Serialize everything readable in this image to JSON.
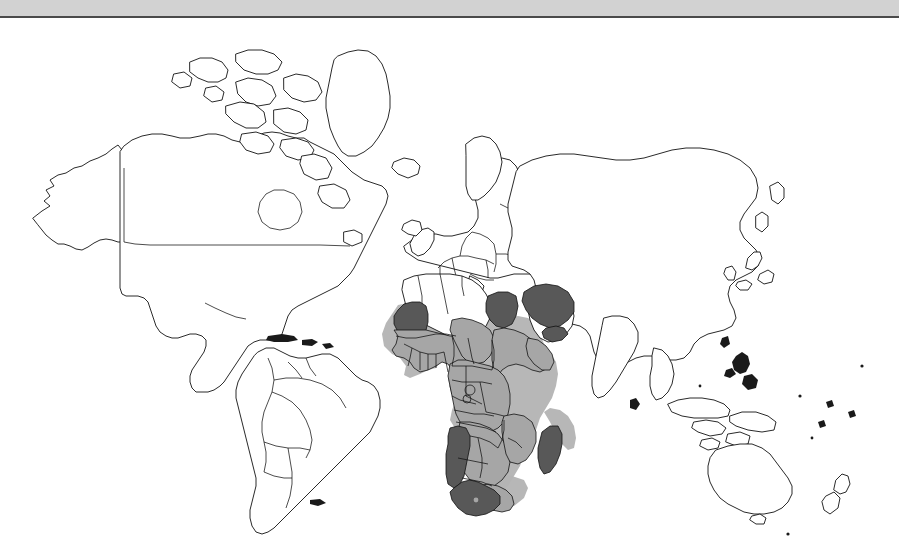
{
  "window": {
    "titlebar_color": "#d2d2d2",
    "background_color": "#ffffff"
  },
  "map": {
    "name": "world-choropleth-map",
    "projection": "miller-cylindrical",
    "outline_color": "#121212",
    "ocean_color": "#ffffff",
    "land_default_color": "#ffffff",
    "shade_light_color": "#a6a6a6",
    "shade_dark_color": "#585858",
    "halo_color": "#b3b3b3",
    "categories": [
      {
        "key": "none",
        "label": "",
        "color": "#ffffff"
      },
      {
        "key": "light",
        "label": "",
        "color": "#a6a6a6"
      },
      {
        "key": "dark",
        "label": "",
        "color": "#585858"
      }
    ],
    "regions": [
      {
        "id": "mauritania",
        "shade": "dark"
      },
      {
        "id": "senegal",
        "shade": "light"
      },
      {
        "id": "gambia",
        "shade": "light"
      },
      {
        "id": "guinea-bissau",
        "shade": "light"
      },
      {
        "id": "guinea",
        "shade": "light"
      },
      {
        "id": "sierra-leone",
        "shade": "light"
      },
      {
        "id": "liberia",
        "shade": "light"
      },
      {
        "id": "cote-divoire",
        "shade": "light"
      },
      {
        "id": "mali",
        "shade": "light"
      },
      {
        "id": "burkina-faso",
        "shade": "light"
      },
      {
        "id": "ghana",
        "shade": "light"
      },
      {
        "id": "togo",
        "shade": "light"
      },
      {
        "id": "benin",
        "shade": "light"
      },
      {
        "id": "niger",
        "shade": "light"
      },
      {
        "id": "nigeria",
        "shade": "light"
      },
      {
        "id": "chad",
        "shade": "light"
      },
      {
        "id": "cameroon",
        "shade": "light"
      },
      {
        "id": "central-african-republic",
        "shade": "light"
      },
      {
        "id": "sudan",
        "shade": "light"
      },
      {
        "id": "south-sudan",
        "shade": "light"
      },
      {
        "id": "ethiopia",
        "shade": "light"
      },
      {
        "id": "eritrea",
        "shade": "light"
      },
      {
        "id": "djibouti",
        "shade": "light"
      },
      {
        "id": "somalia",
        "shade": "light"
      },
      {
        "id": "kenya",
        "shade": "light"
      },
      {
        "id": "uganda",
        "shade": "light"
      },
      {
        "id": "rwanda",
        "shade": "light"
      },
      {
        "id": "burundi",
        "shade": "light"
      },
      {
        "id": "tanzania",
        "shade": "light"
      },
      {
        "id": "dr-congo",
        "shade": "light"
      },
      {
        "id": "congo",
        "shade": "light"
      },
      {
        "id": "gabon",
        "shade": "light"
      },
      {
        "id": "angola",
        "shade": "light"
      },
      {
        "id": "zambia",
        "shade": "light"
      },
      {
        "id": "malawi",
        "shade": "light"
      },
      {
        "id": "mozambique",
        "shade": "light"
      },
      {
        "id": "zimbabwe",
        "shade": "light"
      },
      {
        "id": "botswana",
        "shade": "light"
      },
      {
        "id": "lesotho",
        "shade": "light"
      },
      {
        "id": "egypt",
        "shade": "dark"
      },
      {
        "id": "saudi-arabia",
        "shade": "dark"
      },
      {
        "id": "yemen",
        "shade": "dark"
      },
      {
        "id": "namibia",
        "shade": "dark"
      },
      {
        "id": "south-africa",
        "shade": "dark"
      },
      {
        "id": "madagascar",
        "shade": "dark"
      }
    ],
    "unshaded_continents": [
      "north-america",
      "south-america",
      "europe",
      "asia",
      "australia",
      "greenland",
      "antarctica-excluded"
    ]
  }
}
